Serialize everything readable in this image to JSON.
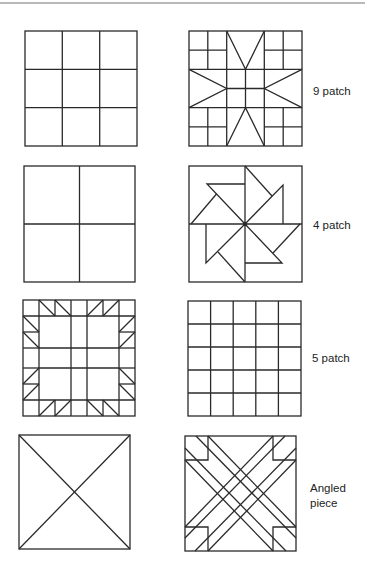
{
  "labels": {
    "row1": "9 patch",
    "row2": "4 patch",
    "row3": "5 patch",
    "row4_line1": "Angled",
    "row4_line2": "piece"
  },
  "colors": {
    "stroke": "#2a2a2a",
    "background": "#ffffff",
    "top_rule": "#b8b8b8"
  },
  "rows": [
    {
      "left": "plain 3x3 grid",
      "right": "eight-pointed star block on 9 patch grid",
      "label": "9 patch"
    },
    {
      "left": "plain 2x2 grid",
      "right": "pinwheel block on 4 patch grid",
      "label": "4 patch"
    },
    {
      "left": "sawtooth bordered block",
      "right": "plain 5x5 grid",
      "label": "5 patch"
    },
    {
      "left": "square with diagonals",
      "right": "interwoven diagonal strips block",
      "label": "Angled piece"
    }
  ]
}
